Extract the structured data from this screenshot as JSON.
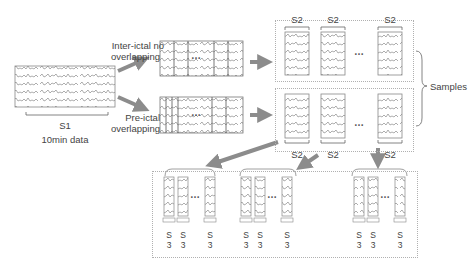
{
  "diagram": {
    "type": "eeg-segmentation-flow",
    "source": {
      "label": "S1",
      "caption": "10min data"
    },
    "branches": [
      {
        "label_line1": "Inter-ictal no",
        "label_line2": "overlapping"
      },
      {
        "label_line1": "Pre-ictal",
        "label_line2": "overlapping"
      }
    ],
    "ellipsis": "…",
    "s2_label": "S2",
    "samples_label": "Samples",
    "s3_label_line1": "S",
    "s3_label_line2": "3",
    "colors": {
      "arrow": "#8c8c8c",
      "line": "#888888",
      "dotted": "#b0b0b0",
      "text": "#444444"
    }
  }
}
